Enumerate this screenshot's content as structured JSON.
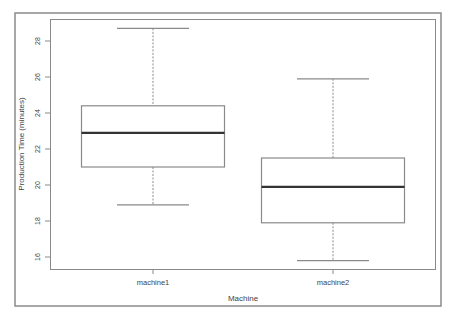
{
  "chart_data": {
    "type": "boxplot",
    "title": "",
    "xlabel": "Machine",
    "ylabel": "Production Time (minutes)",
    "categories": [
      "machine1",
      "machine2"
    ],
    "yticks": [
      16,
      18,
      20,
      22,
      24,
      26,
      28
    ],
    "ylim": [
      15.3,
      29.2
    ],
    "grid": false,
    "legend": null,
    "series": [
      {
        "name": "machine1",
        "whisker_low": 18.9,
        "q1": 21.0,
        "median": 22.9,
        "q3": 24.4,
        "whisker_high": 28.7
      },
      {
        "name": "machine2",
        "whisker_low": 15.8,
        "q1": 17.9,
        "median": 19.9,
        "q3": 21.5,
        "whisker_high": 25.9
      }
    ]
  },
  "colors": {
    "frame": "#8a8a8a",
    "box": "#8a8a8a",
    "median": "#333333",
    "text": "#444444"
  }
}
